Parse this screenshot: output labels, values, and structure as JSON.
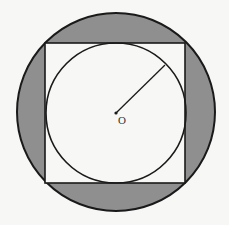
{
  "diagram": {
    "colors": {
      "background": "#f7f7f5",
      "shaded": "#8f8f8f",
      "stroke": "#1a1a1a",
      "inner_fill": "#f7f7f5"
    },
    "outer_circle": {
      "cx": 116,
      "cy": 112,
      "r": 99
    },
    "square": {
      "x": 45,
      "y": 43,
      "size": 140
    },
    "inner_circle": {
      "cx": 116,
      "cy": 113,
      "r": 70
    },
    "center_point": {
      "cx": 116,
      "cy": 113,
      "label": "O"
    },
    "radius_line": {
      "x1": 116,
      "y1": 113,
      "x2": 165,
      "y2": 65
    }
  }
}
